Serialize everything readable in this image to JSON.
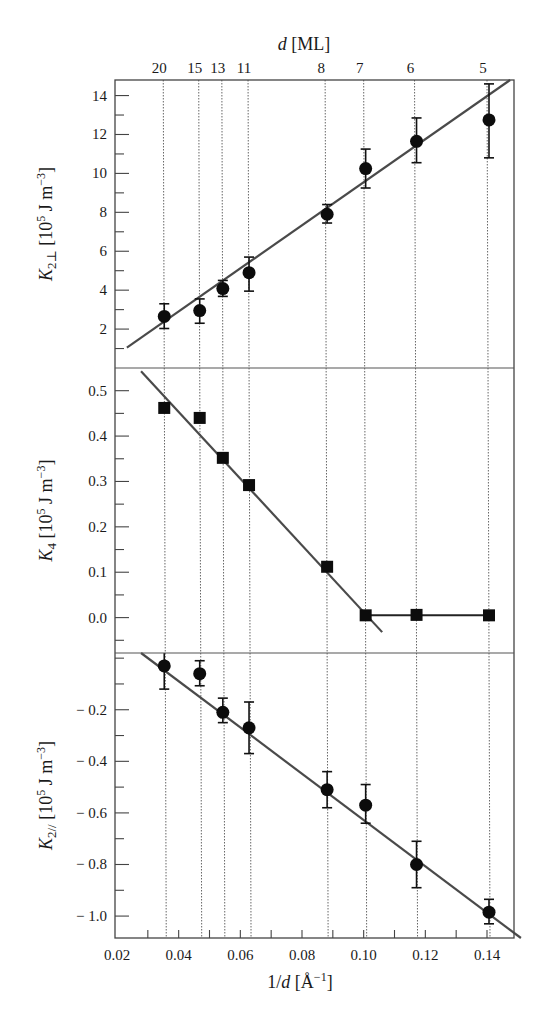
{
  "chart_data": {
    "type": "scatter",
    "title": "",
    "layout": "three vertically stacked panels sharing x-axis, with secondary top axis",
    "x_axis": {
      "label_prefix": "1/",
      "label_var": "d",
      "label_unit": "[Å",
      "label_exp": "−1",
      "label_suffix": "]",
      "label": "1/d [Å^-1]",
      "range": [
        0.02,
        0.15
      ],
      "ticks": [
        0.02,
        0.04,
        0.06,
        0.08,
        0.1,
        0.12,
        0.14
      ],
      "tick_labels": [
        "0.02",
        "0.04",
        "0.06",
        "0.08",
        "0.10",
        "0.12",
        "0.14"
      ],
      "minor_step": 0.01
    },
    "top_axis": {
      "label_var": "d",
      "label_unit": "[ML]",
      "label": "d [ML]",
      "thickness_labels": [
        "20",
        "15",
        "13",
        "11",
        "8",
        "7",
        "6",
        "5"
      ],
      "positions": [
        0.035,
        0.0465,
        0.054,
        0.0625,
        0.0875,
        0.1,
        0.1165,
        0.14
      ],
      "vertical_guides": "dotted"
    },
    "panels": [
      {
        "id": "K2perp",
        "ylabel_var": "K",
        "ylabel_sub": "2⊥",
        "ylabel_unit": "[10",
        "ylabel_exp": "5",
        "ylabel_rest": " J m",
        "ylabel_exp2": "−3",
        "ylabel_end": "]",
        "ylabel": "K2⊥ [10^5 J m^-3]",
        "ylim": [
          0,
          14.8
        ],
        "ticks": [
          2,
          4,
          6,
          8,
          10,
          12,
          14
        ],
        "tick_labels": [
          "2",
          "4",
          "6",
          "8",
          "10",
          "12",
          "14"
        ],
        "minor_step": 1,
        "marker": "circle",
        "points": [
          {
            "d_ML": 20,
            "x": 0.035,
            "y": 2.65,
            "err_lo": 2.03,
            "err_hi": 3.3
          },
          {
            "d_ML": 15,
            "x": 0.0465,
            "y": 2.95,
            "err_lo": 2.3,
            "err_hi": 3.55
          },
          {
            "d_ML": 13,
            "x": 0.054,
            "y": 4.08,
            "err_lo": 3.68,
            "err_hi": 4.5
          },
          {
            "d_ML": 11,
            "x": 0.0625,
            "y": 4.9,
            "err_lo": 3.95,
            "err_hi": 5.7
          },
          {
            "d_ML": 8,
            "x": 0.0875,
            "y": 7.9,
            "err_lo": 7.45,
            "err_hi": 8.4
          },
          {
            "d_ML": 7,
            "x": 0.1,
            "y": 10.25,
            "err_lo": 9.25,
            "err_hi": 11.25
          },
          {
            "d_ML": 6,
            "x": 0.1165,
            "y": 11.65,
            "err_lo": 10.55,
            "err_hi": 12.85
          },
          {
            "d_ML": 5,
            "x": 0.14,
            "y": 12.75,
            "err_lo": 10.8,
            "err_hi": 14.6
          }
        ],
        "fit_lines": [
          {
            "x": [
              0.0232,
              0.1475
            ],
            "y": [
              1.05,
              14.8
            ],
            "style": "fit"
          }
        ]
      },
      {
        "id": "K4",
        "ylabel_var": "K",
        "ylabel_sub": "4",
        "ylabel_unit": "[10",
        "ylabel_exp": "5",
        "ylabel_rest": " J m",
        "ylabel_exp2": "−3",
        "ylabel_end": "]",
        "ylabel": "K4 [10^5 J m^-3]",
        "ylim": [
          -0.078,
          0.55
        ],
        "ticks": [
          0.0,
          0.1,
          0.2,
          0.3,
          0.4,
          0.5
        ],
        "tick_labels": [
          "0.0",
          "0.1",
          "0.2",
          "0.3",
          "0.4",
          "0.5"
        ],
        "minor_step": 0.05,
        "marker": "square",
        "points": [
          {
            "d_ML": 20,
            "x": 0.035,
            "y": 0.462
          },
          {
            "d_ML": 15,
            "x": 0.0465,
            "y": 0.44
          },
          {
            "d_ML": 13,
            "x": 0.054,
            "y": 0.352
          },
          {
            "d_ML": 11,
            "x": 0.0625,
            "y": 0.292
          },
          {
            "d_ML": 8,
            "x": 0.0875,
            "y": 0.112
          },
          {
            "d_ML": 7,
            "x": 0.1,
            "y": 0.005
          },
          {
            "d_ML": 6,
            "x": 0.1165,
            "y": 0.006
          },
          {
            "d_ML": 5,
            "x": 0.14,
            "y": 0.005
          }
        ],
        "fit_lines": [
          {
            "x": [
              0.0278,
              0.106
            ],
            "y": [
              0.543,
              -0.032
            ],
            "style": "fit"
          },
          {
            "x": [
              0.1,
              0.14
            ],
            "y": [
              0.005,
              0.005
            ],
            "style": "fit-flat"
          }
        ]
      },
      {
        "id": "K2par",
        "ylabel_var": "K",
        "ylabel_sub": "2//",
        "ylabel_unit": "[10",
        "ylabel_exp": "5",
        "ylabel_rest": " J m",
        "ylabel_exp2": "−3",
        "ylabel_end": "]",
        "ylabel": "K2// [10^5 J m^-3]",
        "ylim": [
          -1.085,
          0.02
        ],
        "ticks": [
          -1.0,
          -0.8,
          -0.6,
          -0.4,
          -0.2
        ],
        "tick_labels": [
          "− 1.0",
          "− 0.8",
          "− 0.6",
          "− 0.4",
          "− 0.2"
        ],
        "minor_step": 0.1,
        "marker": "circle",
        "points": [
          {
            "d_ML": 20,
            "x": 0.035,
            "y": -0.03,
            "err_lo": -0.12,
            "err_hi": 0.02
          },
          {
            "d_ML": 15,
            "x": 0.0465,
            "y": -0.06,
            "err_lo": -0.107,
            "err_hi": -0.01
          },
          {
            "d_ML": 13,
            "x": 0.054,
            "y": -0.21,
            "err_lo": -0.25,
            "err_hi": -0.155
          },
          {
            "d_ML": 11,
            "x": 0.0625,
            "y": -0.27,
            "err_lo": -0.37,
            "err_hi": -0.17
          },
          {
            "d_ML": 8,
            "x": 0.0875,
            "y": -0.51,
            "err_lo": -0.58,
            "err_hi": -0.44
          },
          {
            "d_ML": 7,
            "x": 0.1,
            "y": -0.57,
            "err_lo": -0.64,
            "err_hi": -0.49
          },
          {
            "d_ML": 6,
            "x": 0.1165,
            "y": -0.8,
            "err_lo": -0.89,
            "err_hi": -0.71
          },
          {
            "d_ML": 5,
            "x": 0.14,
            "y": -0.985,
            "err_lo": -1.03,
            "err_hi": -0.935
          }
        ],
        "fit_lines": [
          {
            "x": [
              0.0278,
              0.151
            ],
            "y": [
              0.02,
              -1.085
            ],
            "style": "fit"
          }
        ]
      }
    ]
  },
  "layout_px": {
    "plot_left": 115,
    "plot_right": 514,
    "panel_tops": [
      80,
      368,
      653
    ],
    "panel_bottoms": [
      368,
      653,
      938
    ]
  }
}
